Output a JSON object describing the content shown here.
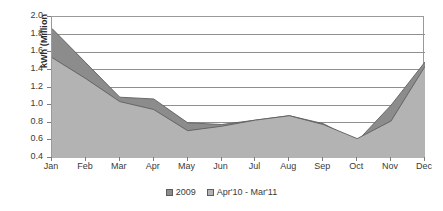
{
  "chart_data": {
    "type": "area",
    "title": "",
    "xlabel": "",
    "ylabel": "kWh (Million",
    "categories": [
      "Jan",
      "Feb",
      "Mar",
      "Apr",
      "May",
      "Jun",
      "Jul",
      "Aug",
      "Sep",
      "Oct",
      "Nov",
      "Dec"
    ],
    "series": [
      {
        "name": "2009",
        "color": "#8c8c8c",
        "values": [
          1.87,
          1.48,
          1.09,
          1.07,
          0.8,
          0.78,
          0.83,
          0.88,
          0.79,
          0.59,
          1.0,
          1.49
        ]
      },
      {
        "name": "Apr'10 - Mar'11",
        "color": "#b3b3b3",
        "values": [
          1.54,
          1.3,
          1.04,
          0.95,
          0.71,
          0.76,
          0.83,
          0.88,
          0.78,
          0.62,
          0.82,
          1.44
        ]
      }
    ],
    "ylim": [
      0.4,
      2.0
    ],
    "y_ticks": [
      "2.0",
      "1.8",
      "1.6",
      "1.4",
      "1.2",
      "1.0",
      "0.8",
      "0.6",
      "0.4"
    ],
    "y_tick_values": [
      2.0,
      1.8,
      1.6,
      1.4,
      1.2,
      1.0,
      0.8,
      0.6,
      0.4
    ],
    "grid": true,
    "gridlines_horizontal": true,
    "gridlines_vertical": false,
    "legend_position": "bottom"
  },
  "axes": {
    "y_title": "kWh (Million",
    "y_tick_labels": [
      "2.0",
      "1.8",
      "1.6",
      "1.4",
      "1.2",
      "1.0",
      "0.8",
      "0.6",
      "0.4"
    ],
    "x_tick_labels": [
      "Jan",
      "Feb",
      "Mar",
      "Apr",
      "May",
      "Jun",
      "Jul",
      "Aug",
      "Sep",
      "Oct",
      "Nov",
      "Dec"
    ]
  },
  "legend": {
    "items": [
      {
        "label": "2009",
        "color": "#8c8c8c"
      },
      {
        "label": "Apr'10 - Mar'11",
        "color": "#b3b3b3"
      }
    ]
  },
  "colors": {
    "series_2009_fill": "#8c8c8c",
    "series_apr10_mar11_fill": "#b3b3b3",
    "gridline": "#8f8f8f",
    "axis_line": "#9a9a9a",
    "text": "#3a3a3a",
    "plot_background": "#ffffff"
  }
}
